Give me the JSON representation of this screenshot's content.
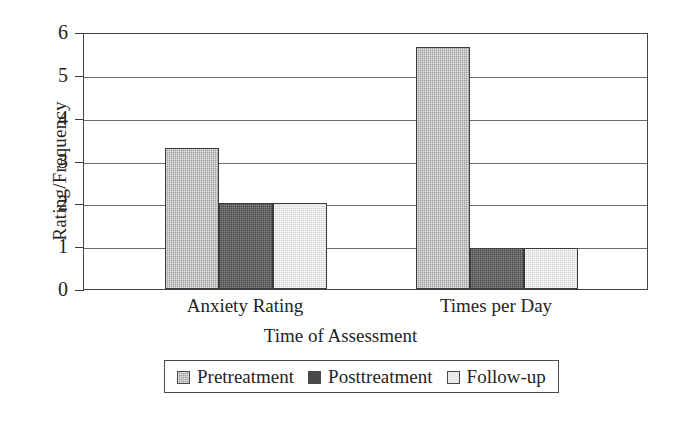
{
  "chart_data": {
    "type": "bar",
    "title": "",
    "subtitle": "",
    "xlabel": "Time of Assessment",
    "ylabel": "Rating/Frequency",
    "categories": [
      "Anxiety Rating",
      "Times per Day"
    ],
    "series": [
      {
        "name": "Pretreatment",
        "values": [
          3.3,
          5.65
        ],
        "color": "#9d9d9d"
      },
      {
        "name": "Posttreatment",
        "values": [
          2.0,
          0.95
        ],
        "color": "#4a4a4a"
      },
      {
        "name": "Follow-up",
        "values": [
          2.0,
          0.95
        ],
        "color": "#d5d5d5"
      }
    ],
    "ylim": [
      0,
      6
    ],
    "ytick_labels": [
      "0",
      "1",
      "2",
      "3",
      "4",
      "5",
      "6"
    ],
    "ytick_values": [
      0,
      1,
      2,
      3,
      4,
      5,
      6
    ],
    "grid": "horizontal",
    "legend_position": "bottom",
    "legend_entries": [
      "Pretreatment",
      "Posttreatment",
      "Follow-up"
    ],
    "annotations": []
  },
  "axes": {
    "y_title": "Rating/Frequency",
    "x_title": "Time of Assessment",
    "y_ticks": [
      {
        "label": "6",
        "value": 6
      },
      {
        "label": "5",
        "value": 5
      },
      {
        "label": "4",
        "value": 4
      },
      {
        "label": "3",
        "value": 3
      },
      {
        "label": "2",
        "value": 2
      },
      {
        "label": "1",
        "value": 1
      },
      {
        "label": "0",
        "value": 0
      }
    ],
    "categories": [
      {
        "label": "Anxiety Rating"
      },
      {
        "label": "Times per Day"
      }
    ]
  },
  "legend": {
    "items": [
      {
        "label": "Pretreatment",
        "swatch": "pre"
      },
      {
        "label": "Posttreatment",
        "swatch": "post"
      },
      {
        "label": "Follow-up",
        "swatch": "follow"
      }
    ]
  },
  "bars": [
    {
      "group": "Anxiety Rating",
      "series": "Pretreatment",
      "value": 3.3,
      "swatch": "pre"
    },
    {
      "group": "Anxiety Rating",
      "series": "Posttreatment",
      "value": 2.0,
      "swatch": "post"
    },
    {
      "group": "Anxiety Rating",
      "series": "Follow-up",
      "value": 2.0,
      "swatch": "follow"
    },
    {
      "group": "Times per Day",
      "series": "Pretreatment",
      "value": 5.65,
      "swatch": "pre"
    },
    {
      "group": "Times per Day",
      "series": "Posttreatment",
      "value": 0.95,
      "swatch": "post"
    },
    {
      "group": "Times per Day",
      "series": "Follow-up",
      "value": 0.95,
      "swatch": "follow"
    }
  ]
}
